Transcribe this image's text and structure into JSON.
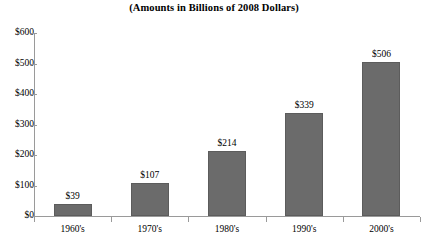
{
  "chart_data": {
    "type": "bar",
    "title": "(Amounts in Billions of 2008 Dollars)",
    "xlabel": "",
    "ylabel": "",
    "categories": [
      "1960's",
      "1970's",
      "1980's",
      "1990's",
      "2000's"
    ],
    "values": [
      39,
      107,
      214,
      339,
      506
    ],
    "data_labels": [
      "$39",
      "$107",
      "$214",
      "$339",
      "$506"
    ],
    "ylim": [
      0,
      600
    ],
    "ytick_values": [
      0,
      100,
      200,
      300,
      400,
      500,
      600
    ],
    "ytick_labels": [
      "$0",
      "$100",
      "$200",
      "$300",
      "$400",
      "$500",
      "$600"
    ],
    "grid": false,
    "legend": false,
    "legend_position": "none",
    "bar_color": "#6b6b6b",
    "axis_color": "#9a9a9a",
    "background_color": "#ffffff",
    "text_color": "#000000"
  }
}
